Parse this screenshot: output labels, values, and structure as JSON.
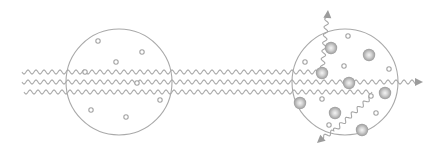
{
  "diagram": {
    "colors": {
      "background": "#ffffff",
      "outline": "#a9a9a9",
      "wave": "#a6a6a6",
      "particle_light": "#f2f2f2",
      "particle_dark": "#9a9a9a",
      "arrow": "#9c9c9c"
    },
    "waves": {
      "wavelength": 8,
      "amplitude": 2,
      "incident": [
        {
          "name": "wave-top",
          "x_start": 22,
          "x_end": 322,
          "y": 72
        },
        {
          "name": "wave-middle",
          "x_start": 22,
          "x_end": 417,
          "y": 82
        },
        {
          "name": "wave-bottom",
          "x_start": 24,
          "x_end": 372,
          "y": 92
        }
      ],
      "scattered": [
        {
          "name": "scattered-up",
          "from": [
            322,
            73
          ],
          "to": [
            327,
            16
          ],
          "arrow": [
            328,
            10
          ]
        },
        {
          "name": "scattered-down-left",
          "from": [
            372,
            96
          ],
          "to": [
            322,
            138
          ],
          "arrow": [
            317,
            143
          ]
        }
      ],
      "arrow_through": {
        "name": "transmitted-arrow",
        "at": [
          423,
          82
        ]
      }
    },
    "media": [
      {
        "name": "sparse-medium",
        "circle": {
          "cx": 119,
          "cy": 82,
          "r": 53
        },
        "small_particles": [
          [
            98,
            41
          ],
          [
            142,
            52
          ],
          [
            116,
            62
          ],
          [
            85,
            72
          ],
          [
            137,
            83
          ],
          [
            160,
            100
          ],
          [
            91,
            110
          ],
          [
            126,
            117
          ]
        ],
        "large_particles": []
      },
      {
        "name": "dense-medium",
        "circle": {
          "cx": 345,
          "cy": 82,
          "r": 53
        },
        "small_particles": [
          [
            348,
            36
          ],
          [
            305,
            62
          ],
          [
            344,
            66
          ],
          [
            389,
            69
          ],
          [
            322,
            99
          ],
          [
            371,
            96
          ],
          [
            376,
            113
          ],
          [
            329,
            125
          ]
        ],
        "large_particles": [
          [
            331,
            48
          ],
          [
            369,
            55
          ],
          [
            322,
            73
          ],
          [
            349,
            83
          ],
          [
            385,
            93
          ],
          [
            300,
            103
          ],
          [
            335,
            113
          ],
          [
            362,
            130
          ]
        ],
        "small_r": 2.2,
        "large_r": 6.2
      }
    ]
  }
}
